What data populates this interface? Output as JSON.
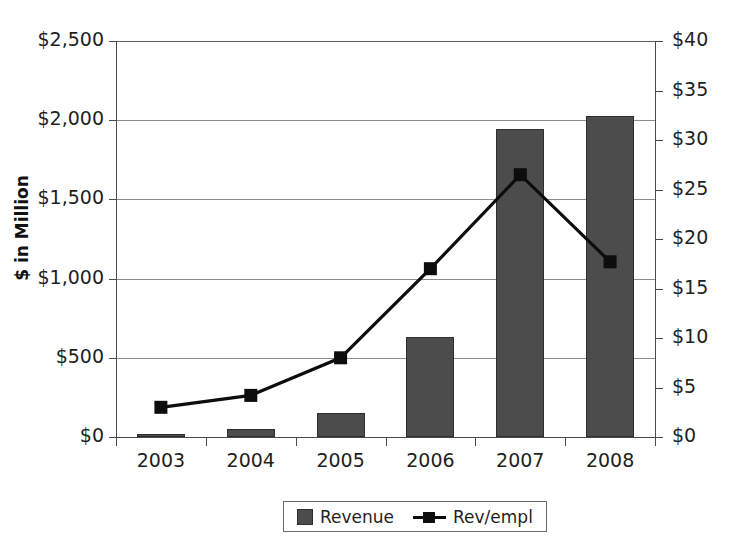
{
  "chart_data": {
    "type": "bar",
    "title": "",
    "categories": [
      "2003",
      "2004",
      "2005",
      "2006",
      "2007",
      "2008"
    ],
    "xlabel": "",
    "ylabel": "$ in Million",
    "ylim": [
      0,
      2500
    ],
    "y_ticks": [
      "$0",
      "$500",
      "$1,000",
      "$1,500",
      "$2,000",
      "$2,500"
    ],
    "y_tick_values": [
      0,
      500,
      1000,
      1500,
      2000,
      2500
    ],
    "y2label": "",
    "y2lim": [
      0,
      40
    ],
    "y2_ticks": [
      "$0",
      "$5",
      "$10",
      "$15",
      "$20",
      "$25",
      "$30",
      "$35",
      "$40"
    ],
    "y2_tick_values": [
      0,
      5,
      10,
      15,
      20,
      25,
      30,
      35,
      40
    ],
    "grid": true,
    "legend_position": "bottom",
    "series": [
      {
        "name": "Revenue",
        "type": "bar",
        "axis": "left",
        "color": "#4c4c4c",
        "values": [
          20,
          50,
          150,
          630,
          1945,
          2025
        ]
      },
      {
        "name": "Rev/empl",
        "type": "line",
        "axis": "right",
        "color": "#0d0d0d",
        "marker": "square",
        "values": [
          3.0,
          4.2,
          8.0,
          17.0,
          26.5,
          17.7
        ]
      }
    ]
  },
  "legend": {
    "items": [
      {
        "label": "Revenue",
        "marker": "square-swatch"
      },
      {
        "label": "Rev/empl",
        "marker": "line-square-marker"
      }
    ]
  },
  "bleed": {
    "top": " ",
    "right": " ",
    "bottom": " "
  }
}
